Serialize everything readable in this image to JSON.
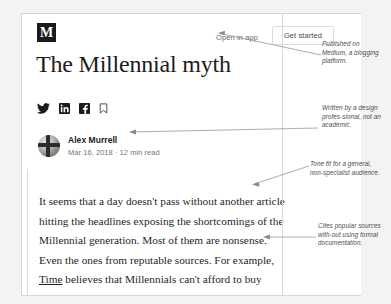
{
  "page": {
    "background_color": "#f4f3f1",
    "card_background": "#ffffff"
  },
  "topbar": {
    "logo_letter": "M",
    "logo_name": "medium-logo",
    "open_in_app_label": "Open in app",
    "get_started_label": "Get started"
  },
  "article": {
    "title": "The Millennial myth",
    "author": "Alex Murrell",
    "meta": "Mar 16, 2018 · 12 min read",
    "body_part_1": "It seems that a day doesn't pass without another article hitting the headlines exposing the shortcomings of the Millennial generation. Most of them are nonsense. Even the ones from reputable sources. For example, ",
    "body_link": "Time",
    "body_part_2": " believes that Millennials can't afford to buy houses because they spend too much money on avocados. And"
  },
  "social_icons": [
    {
      "name": "twitter-icon",
      "label": "Twitter"
    },
    {
      "name": "linkedin-icon",
      "label": "LinkedIn"
    },
    {
      "name": "facebook-icon",
      "label": "Facebook"
    },
    {
      "name": "bookmark-icon",
      "label": "Bookmark"
    }
  ],
  "annotations": [
    {
      "id": "ann-1",
      "text": "Published on Medium, a blogging platform."
    },
    {
      "id": "ann-2",
      "text": "Written by a design profes-sional, not an academic."
    },
    {
      "id": "ann-3",
      "text": "Tone fit for a general, non-specialist audience."
    },
    {
      "id": "ann-4",
      "text": "Cites popular sources with-out using formal documentation."
    }
  ]
}
